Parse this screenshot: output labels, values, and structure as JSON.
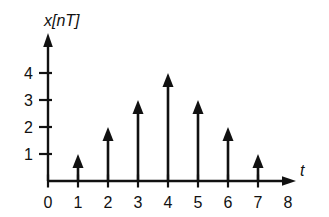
{
  "chart_data": {
    "type": "bar",
    "title": "",
    "subtitle": "",
    "ylabel": "x[nT]",
    "xlabel": "t",
    "categories": [
      "0",
      "1",
      "2",
      "3",
      "4",
      "5",
      "6",
      "7",
      "8"
    ],
    "x": [
      0,
      1,
      2,
      3,
      4,
      5,
      6,
      7,
      8
    ],
    "values": [
      0,
      1,
      2,
      3,
      4,
      3,
      2,
      1,
      0
    ],
    "series": [
      {
        "name": "x[nT]",
        "values": [
          0,
          1,
          2,
          3,
          4,
          3,
          2,
          1,
          0
        ]
      }
    ],
    "xtick_labels": [
      "0",
      "1",
      "2",
      "3",
      "4",
      "5",
      "6",
      "7",
      "8"
    ],
    "ytick_labels": [
      "1",
      "2",
      "3",
      "4"
    ],
    "yticks": [
      1,
      2,
      3,
      4
    ],
    "xlim": [
      0,
      8.6
    ],
    "ylim": [
      0,
      4.6
    ],
    "grid": false,
    "legend": false,
    "marker": "arrow"
  },
  "figure": {
    "y_axis_label": "x[nT]",
    "x_axis_label": "t",
    "y_tick_labels": [
      "4",
      "3",
      "2",
      "1"
    ],
    "x_tick_labels": [
      "0",
      "1",
      "2",
      "3",
      "4",
      "5",
      "6",
      "7",
      "8"
    ],
    "stems": [
      {
        "n": "1",
        "value": 1
      },
      {
        "n": "2",
        "value": 2
      },
      {
        "n": "3",
        "value": 3
      },
      {
        "n": "4",
        "value": 4
      },
      {
        "n": "5",
        "value": 3
      },
      {
        "n": "6",
        "value": 2
      },
      {
        "n": "7",
        "value": 1
      }
    ],
    "colors": {
      "ink": "#111111",
      "background": "#ffffff"
    }
  }
}
